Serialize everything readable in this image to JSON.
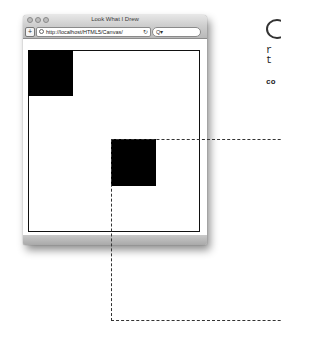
{
  "browser": {
    "title": "Look What I Drew",
    "url": "http://localhost/HTML5/Canvas/",
    "add_button_label": "+",
    "reload_icon": "↻",
    "search_placeholder": "Q▾"
  },
  "canvas": {
    "squares": [
      {
        "name": "top-left-square",
        "x": 28,
        "y": 50,
        "w": 45,
        "h": 46
      },
      {
        "name": "middle-square",
        "x": 111,
        "y": 139,
        "w": 45,
        "h": 47
      }
    ]
  },
  "side_text": {
    "line1": "r",
    "line2": "t",
    "line3": "co"
  },
  "colors": {
    "square": "#000000",
    "canvas_border": "#111111",
    "dashed_border": "#333333"
  }
}
